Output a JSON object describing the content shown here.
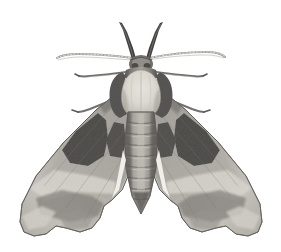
{
  "image": {
    "subject": "moth",
    "common_name": "lime hawk-moth",
    "view": "dorsal specimen, wings spread",
    "style": "grayscale engraving / halftone photograph",
    "background_color": "#ffffff",
    "width": 281,
    "height": 252
  },
  "palette": {
    "background": "#ffffff",
    "wing_light": "#cfcdc9",
    "wing_mid": "#9b9892",
    "wing_dark": "#6d6a66",
    "blotch_dark": "#2b2a28",
    "body_pale": "#e2dfd8",
    "body_mid": "#a5a19a",
    "body_dark": "#4a4845",
    "antenna": "#b9b6b0",
    "outline": "#55534f"
  },
  "parts": {
    "head": {
      "label": "head",
      "cx": 141,
      "cy": 62
    },
    "thorax": {
      "label": "thorax",
      "cx": 141,
      "cy": 92
    },
    "abdomen": {
      "label": "abdomen",
      "cx": 141,
      "cy": 160,
      "segment_count": 8
    },
    "left_forewing": {
      "label": "left forewing",
      "tip_x": 22,
      "tip_y": 236
    },
    "right_forewing": {
      "label": "right forewing",
      "tip_x": 259,
      "tip_y": 236
    },
    "left_antenna": {
      "label": "left antenna",
      "tip_x": 57,
      "tip_y": 58
    },
    "right_antenna": {
      "label": "right antenna",
      "tip_x": 225,
      "tip_y": 57
    },
    "left_palpus": {
      "label": "left palpus",
      "tip_x": 120,
      "tip_y": 22
    },
    "right_palpus": {
      "label": "right palpus",
      "tip_x": 162,
      "tip_y": 22
    },
    "left_legs": {
      "label": "left legs",
      "count": 2
    },
    "right_legs": {
      "label": "right legs",
      "count": 2
    },
    "left_blotches": {
      "label": "left wing dark blotches",
      "count": 2
    },
    "right_blotches": {
      "label": "right wing dark blotches",
      "count": 2
    }
  }
}
